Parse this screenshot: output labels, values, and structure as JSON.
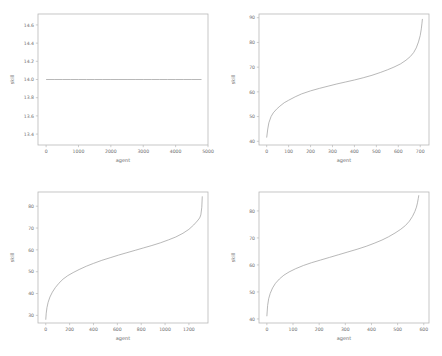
{
  "figure": {
    "background_color": "#ffffff",
    "line_color": "#9a9a9a",
    "spine_color": "#b8b8b8",
    "tick_label_color": "#6e6e6e",
    "rows": 2,
    "cols": 2
  },
  "chart_data": [
    {
      "type": "line",
      "position": "top-left",
      "title": "",
      "xlabel": "agent",
      "ylabel": "skill",
      "xlim": [
        -250,
        5000
      ],
      "ylim": [
        13.28,
        14.72
      ],
      "xticks": [
        0,
        1000,
        2000,
        3000,
        4000,
        5000
      ],
      "xticklabels": [
        "0",
        "1000",
        "2000",
        "3000",
        "4000",
        "5000"
      ],
      "yticks": [
        13.4,
        13.6,
        13.8,
        14.0,
        14.2,
        14.4,
        14.6
      ],
      "yticklabels": [
        "13.4",
        "13.6",
        "13.8",
        "14.0",
        "14.2",
        "14.4",
        "14.6"
      ],
      "grid": false,
      "legend": null,
      "series": [
        {
          "name": "skill",
          "x": [
            0,
            250,
            500,
            750,
            1000,
            1250,
            1500,
            1750,
            2000,
            2250,
            2500,
            2750,
            3000,
            3250,
            3500,
            3750,
            4000,
            4250,
            4500,
            4800
          ],
          "y": [
            14.0,
            14.0,
            14.0,
            14.0,
            14.0,
            14.0,
            14.0,
            14.0,
            14.0,
            14.0,
            14.0,
            14.0,
            14.0,
            14.0,
            14.0,
            14.0,
            14.0,
            14.0,
            14.0,
            14.0
          ]
        }
      ]
    },
    {
      "type": "line",
      "position": "top-right",
      "title": "",
      "xlabel": "agent",
      "ylabel": "skill",
      "xlim": [
        -35,
        740
      ],
      "ylim": [
        38.5,
        91.5
      ],
      "xticks": [
        0,
        100,
        200,
        300,
        400,
        500,
        600,
        700
      ],
      "xticklabels": [
        "0",
        "100",
        "200",
        "300",
        "400",
        "500",
        "600",
        "700"
      ],
      "yticks": [
        40,
        50,
        60,
        70,
        80,
        90
      ],
      "yticklabels": [
        "40",
        "50",
        "60",
        "70",
        "80",
        "90"
      ],
      "grid": false,
      "legend": null,
      "series": [
        {
          "name": "skill",
          "x": [
            0,
            5,
            10,
            20,
            30,
            45,
            60,
            80,
            100,
            130,
            160,
            200,
            240,
            280,
            320,
            360,
            400,
            440,
            480,
            520,
            550,
            580,
            610,
            635,
            655,
            670,
            682,
            692,
            700,
            705,
            708,
            710
          ],
          "y": [
            41.5,
            45.0,
            47.5,
            50.0,
            51.5,
            53.0,
            54.2,
            55.6,
            56.6,
            58.0,
            59.2,
            60.4,
            61.4,
            62.3,
            63.2,
            64.0,
            64.8,
            65.7,
            66.7,
            67.9,
            68.9,
            70.0,
            71.3,
            72.8,
            74.3,
            75.9,
            77.8,
            80.2,
            82.8,
            85.5,
            87.8,
            89.5
          ]
        }
      ]
    },
    {
      "type": "line",
      "position": "bottom-left",
      "title": "",
      "xlabel": "agent",
      "ylabel": "skill",
      "xlim": [
        -65,
        1360
      ],
      "ylim": [
        26.5,
        86.5
      ],
      "xticks": [
        0,
        200,
        400,
        600,
        800,
        1000,
        1200
      ],
      "xticklabels": [
        "0",
        "200",
        "400",
        "600",
        "800",
        "1000",
        "1200"
      ],
      "yticks": [
        30,
        40,
        50,
        60,
        70,
        80
      ],
      "yticklabels": [
        "30",
        "40",
        "50",
        "60",
        "70",
        "80"
      ],
      "grid": false,
      "legend": null,
      "series": [
        {
          "name": "skill",
          "x": [
            0,
            4,
            10,
            20,
            35,
            55,
            80,
            110,
            145,
            185,
            230,
            280,
            340,
            400,
            470,
            540,
            610,
            680,
            750,
            820,
            890,
            960,
            1030,
            1090,
            1150,
            1200,
            1240,
            1270,
            1290,
            1300,
            1308,
            1312
          ],
          "y": [
            28.0,
            31.0,
            33.5,
            36.0,
            38.4,
            40.6,
            42.7,
            44.7,
            46.6,
            48.2,
            49.6,
            51.0,
            52.5,
            53.8,
            55.2,
            56.4,
            57.6,
            58.7,
            59.8,
            60.9,
            62.0,
            63.2,
            64.6,
            65.9,
            67.6,
            69.4,
            71.4,
            73.2,
            74.6,
            76.0,
            79.5,
            84.5
          ]
        }
      ]
    },
    {
      "type": "line",
      "position": "bottom-right",
      "title": "",
      "xlabel": "agent",
      "ylabel": "skill",
      "xlim": [
        -30,
        620
      ],
      "ylim": [
        38.5,
        87.0
      ],
      "xticks": [
        0,
        100,
        200,
        300,
        400,
        500,
        600
      ],
      "xticklabels": [
        "0",
        "100",
        "200",
        "300",
        "400",
        "500",
        "600"
      ],
      "yticks": [
        40,
        50,
        60,
        70,
        80
      ],
      "yticklabels": [
        "40",
        "50",
        "60",
        "70",
        "80"
      ],
      "grid": false,
      "legend": null,
      "series": [
        {
          "name": "skill",
          "x": [
            0,
            3,
            7,
            13,
            22,
            33,
            48,
            65,
            85,
            110,
            140,
            170,
            205,
            240,
            275,
            310,
            345,
            380,
            410,
            440,
            465,
            490,
            512,
            530,
            545,
            557,
            566,
            572,
            576,
            579,
            581
          ],
          "y": [
            41.0,
            45.0,
            47.5,
            49.5,
            51.5,
            53.2,
            54.8,
            56.2,
            57.4,
            58.6,
            59.8,
            60.8,
            61.8,
            62.8,
            63.8,
            64.8,
            65.8,
            66.9,
            68.0,
            69.2,
            70.4,
            71.8,
            73.2,
            74.6,
            76.2,
            78.0,
            79.8,
            81.4,
            83.0,
            84.6,
            85.8
          ]
        }
      ]
    }
  ]
}
